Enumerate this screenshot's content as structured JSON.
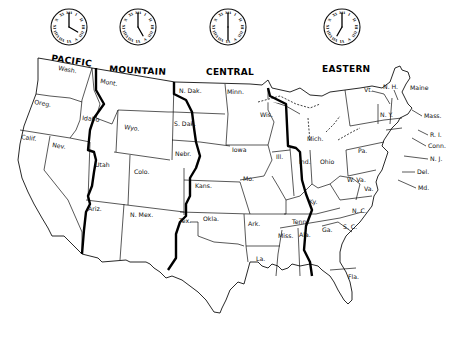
{
  "map": {
    "title": "U.S. Standard Time Zones",
    "zones": [
      {
        "id": "pacific",
        "label": "PACIFIC",
        "clock_time": "4:00",
        "hour": 4,
        "minute": 0
      },
      {
        "id": "mountain",
        "label": "MOUNTAIN",
        "clock_time": "5:00",
        "hour": 5,
        "minute": 0
      },
      {
        "id": "central",
        "label": "CENTRAL",
        "clock_time": "6:00",
        "hour": 6,
        "minute": 0
      },
      {
        "id": "eastern",
        "label": "EASTERN",
        "clock_time": "7:00",
        "hour": 7,
        "minute": 0
      }
    ],
    "states": {
      "wash": "Wash.",
      "oreg": "Oreg.",
      "calif": "Calif.",
      "nev": "Nev.",
      "idaho": "Idaho",
      "mont": "Mont.",
      "wyo": "Wyo.",
      "utah": "Utah",
      "colo": "Colo.",
      "ariz": "Ariz.",
      "nmex": "N. Mex.",
      "ndak": "N. Dak.",
      "sdak": "S. Dak.",
      "nebr": "Nebr.",
      "kans": "Kans.",
      "okla": "Okla.",
      "tex": "Tex.",
      "minn": "Minn.",
      "iowa": "Iowa",
      "mo": "Mo.",
      "ark": "Ark.",
      "la": "La.",
      "wis": "Wis.",
      "ill": "Ill.",
      "mich": "Mich.",
      "ind": "Ind.",
      "ohio": "Ohio",
      "ky": "Ky.",
      "tenn": "Tenn.",
      "miss": "Miss.",
      "ala": "Ala.",
      "ga": "Ga.",
      "fla": "Fla.",
      "sc": "S. C.",
      "nc": "N. C.",
      "va": "Va.",
      "wva": "W. Va.",
      "pa": "Pa.",
      "ny": "N. Y.",
      "vt": "Vt.",
      "nh": "N. H.",
      "maine": "Maine",
      "mass": "Mass.",
      "ri": "R. I.",
      "conn": "Conn.",
      "nj": "N. J.",
      "del": "Del.",
      "md": "Md."
    }
  }
}
